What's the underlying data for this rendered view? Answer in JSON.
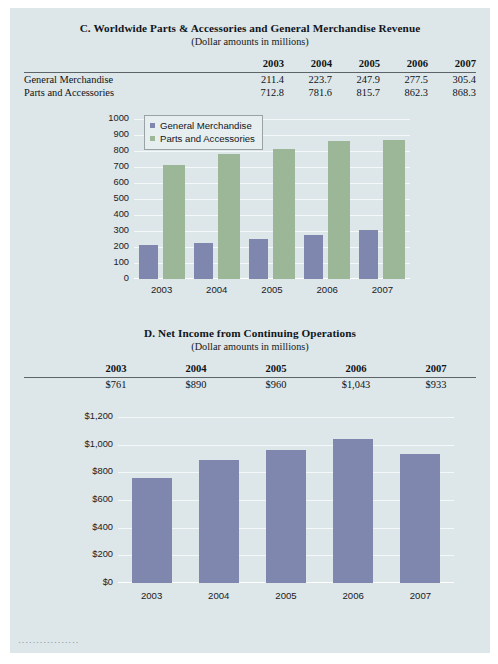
{
  "page": {
    "background": "#dde6e8",
    "footer_marks": "·················"
  },
  "section_c": {
    "title": "C. Worldwide Parts & Accessories and General Merchandise Revenue",
    "subtitle": "(Dollar amounts in millions)",
    "table": {
      "row_label_header": "",
      "columns": [
        "2003",
        "2004",
        "2005",
        "2006",
        "2007"
      ],
      "rows": [
        {
          "label": "General Merchandise",
          "values": [
            "211.4",
            "223.7",
            "247.9",
            "277.5",
            "305.4"
          ]
        },
        {
          "label": "Parts and Accessories",
          "values": [
            "712.8",
            "781.6",
            "815.7",
            "862.3",
            "868.3"
          ]
        }
      ]
    }
  },
  "section_d": {
    "title": "D. Net Income from Continuing Operations",
    "subtitle": "(Dollar amounts in millions)",
    "table": {
      "columns": [
        "2003",
        "2004",
        "2005",
        "2006",
        "2007"
      ],
      "values": [
        "$761",
        "$890",
        "$960",
        "$1,043",
        "$933"
      ]
    }
  },
  "chart_data": [
    {
      "id": "chart-c",
      "type": "bar",
      "title": "",
      "categories": [
        "2003",
        "2004",
        "2005",
        "2006",
        "2007"
      ],
      "series": [
        {
          "name": "General Merchandise",
          "color": "#8087ae",
          "values": [
            211.4,
            223.7,
            247.9,
            277.5,
            305.4
          ]
        },
        {
          "name": "Parts and Accessories",
          "color": "#9cb798",
          "values": [
            712.8,
            781.6,
            815.7,
            862.3,
            868.3
          ]
        }
      ],
      "yticks": [
        "0",
        "100",
        "200",
        "300",
        "400",
        "500",
        "600",
        "700",
        "800",
        "900",
        "1000"
      ],
      "ylim": [
        0,
        1000
      ],
      "xlabel": "",
      "ylabel": "",
      "grid": true,
      "legend_position": "top-left",
      "legend": [
        "General Merchandise",
        "Parts and Accessories"
      ]
    },
    {
      "id": "chart-d",
      "type": "bar",
      "title": "",
      "categories": [
        "2003",
        "2004",
        "2005",
        "2006",
        "2007"
      ],
      "series": [
        {
          "name": "Net Income",
          "color": "#8087ae",
          "values": [
            761,
            890,
            960,
            1043,
            933
          ]
        }
      ],
      "yticks": [
        "$0",
        "$200",
        "$400",
        "$600",
        "$800",
        "$1,000",
        "$1,200"
      ],
      "ylim": [
        0,
        1200
      ],
      "xlabel": "",
      "ylabel": "",
      "grid": true,
      "legend_position": "none",
      "legend": []
    }
  ]
}
